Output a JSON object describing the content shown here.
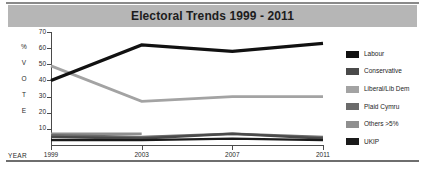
{
  "figure": {
    "title": "Electoral Trends 1999 - 2011",
    "title_bg": "#b6b6b6",
    "background": "#ffffff"
  },
  "axes": {
    "y_caption_letters": [
      "%",
      "V",
      "O",
      "T",
      "E"
    ],
    "y_caption": "% VOTE",
    "y_ticks": [
      "70",
      "60",
      "50",
      "40",
      "30",
      "20",
      "10"
    ],
    "x_caption": "YEAR",
    "x_ticks": [
      "1999",
      "2003",
      "2007",
      "2011"
    ]
  },
  "legend": {
    "position": "right",
    "items": [
      {
        "label": "Labour",
        "color": "#111111"
      },
      {
        "label": "Conservative",
        "color": "#4a4a4a"
      },
      {
        "label": "Liberal/Lib Dem",
        "color": "#a3a3a3"
      },
      {
        "label": "Plaid Cymru",
        "color": "#6b6b6b"
      },
      {
        "label": "Others >5%",
        "color": "#8f8f8f"
      },
      {
        "label": "UKIP",
        "color": "#1a1a1a"
      }
    ]
  },
  "chart_data": {
    "type": "line",
    "title": "Electoral Trends 1999 - 2011",
    "xlabel": "YEAR",
    "ylabel": "% VOTE",
    "categories": [
      "1999",
      "2003",
      "2007",
      "2011"
    ],
    "x": [
      1999,
      2003,
      2007,
      2011
    ],
    "ylim": [
      0,
      70
    ],
    "yticks": [
      10,
      20,
      30,
      40,
      50,
      60,
      70
    ],
    "grid": false,
    "legend_position": "right",
    "series": [
      {
        "name": "Labour",
        "color": "#111111",
        "width": 3.2,
        "values": [
          40,
          62,
          58,
          63
        ]
      },
      {
        "name": "Conservative",
        "color": "#4a4a4a",
        "width": 2.6,
        "values": [
          5,
          4,
          7,
          4
        ]
      },
      {
        "name": "Liberal/Lib Dem",
        "color": "#a3a3a3",
        "width": 2.8,
        "values": [
          49,
          27,
          30,
          30
        ]
      },
      {
        "name": "Plaid Cymru",
        "color": "#6b6b6b",
        "width": 2.4,
        "values": [
          6,
          5,
          7,
          5
        ]
      },
      {
        "name": "Others >5%",
        "color": "#8f8f8f",
        "width": 2.6,
        "values": [
          7,
          7,
          null,
          null
        ]
      },
      {
        "name": "UKIP",
        "color": "#1a1a1a",
        "width": 2.2,
        "values": [
          3,
          3,
          4,
          3
        ]
      }
    ]
  }
}
